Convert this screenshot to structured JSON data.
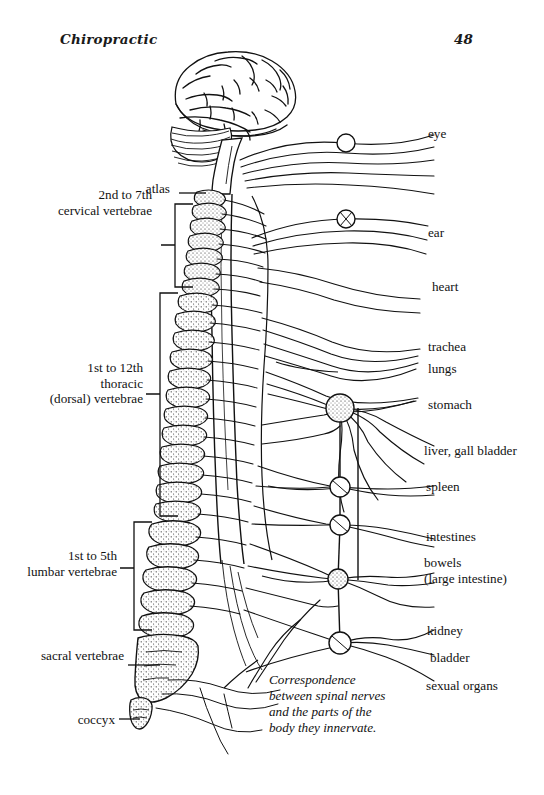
{
  "page": {
    "width": 544,
    "height": 795,
    "background_color": "#ffffff",
    "ink_color": "#121212"
  },
  "header": {
    "title": "Chiropractic",
    "page_number": "48"
  },
  "figure": {
    "style": "black and white line drawing",
    "caption": "Correspondence\nbetween spinal nerves\nand the parts of the\nbody they innervate."
  },
  "left_labels": [
    {
      "id": "atlas",
      "text": "atlas",
      "x": 171,
      "y": 188,
      "leader": "line"
    },
    {
      "id": "cervical",
      "text": "2nd to 7th\ncervical vertebrae",
      "x": 152,
      "y": 194,
      "leader": "bracket"
    },
    {
      "id": "thoracic",
      "text": "1st to 12th\nthoracic\n(dorsal) vertebrae",
      "x": 147,
      "y": 367,
      "leader": "bracket"
    },
    {
      "id": "lumbar",
      "text": "1st to 5th\nlumbar vertebrae",
      "x": 136,
      "y": 555,
      "leader": "bracket"
    },
    {
      "id": "sacral",
      "text": "sacral vertebrae",
      "x": 128,
      "y": 655,
      "leader": "line"
    },
    {
      "id": "coccyx",
      "text": "coccyx",
      "x": 127,
      "y": 713,
      "leader": "line"
    }
  ],
  "right_labels": [
    {
      "id": "eye",
      "text": "eye",
      "x": 428,
      "y": 133
    },
    {
      "id": "ear",
      "text": "ear",
      "x": 428,
      "y": 232
    },
    {
      "id": "heart",
      "text": "heart",
      "x": 432,
      "y": 286
    },
    {
      "id": "trackea",
      "text": "trachea",
      "x": 428,
      "y": 346
    },
    {
      "id": "lungs",
      "text": "lungs",
      "x": 428,
      "y": 368
    },
    {
      "id": "stomach",
      "text": "stomach",
      "x": 428,
      "y": 404
    },
    {
      "id": "liver-gall-bladder",
      "text": "liver, gall bladder",
      "x": 424,
      "y": 450
    },
    {
      "id": "spleen",
      "text": "spleen",
      "x": 426,
      "y": 486
    },
    {
      "id": "intestines",
      "text": "intestines",
      "x": 426,
      "y": 536
    },
    {
      "id": "bowels",
      "text": "bowels\n(large intestine)",
      "x": 424,
      "y": 562
    },
    {
      "id": "kidney",
      "text": "kidney",
      "x": 427,
      "y": 630
    },
    {
      "id": "bladder",
      "text": "bladder",
      "x": 430,
      "y": 657
    },
    {
      "id": "sexual-organs",
      "text": "sexual organs",
      "x": 426,
      "y": 685
    }
  ],
  "ganglia": [
    {
      "id": "ganglion-cervical-upper",
      "cx": 346,
      "cy": 143,
      "r": 9
    },
    {
      "id": "ganglion-cervical-lower",
      "cx": 346,
      "cy": 219,
      "r": 9
    },
    {
      "id": "ganglion-celiac",
      "cx": 340,
      "cy": 408,
      "r": 14
    },
    {
      "id": "ganglion-spleen",
      "cx": 340,
      "cy": 487,
      "r": 10
    },
    {
      "id": "ganglion-intestines",
      "cx": 340,
      "cy": 525,
      "r": 10
    },
    {
      "id": "ganglion-bowels",
      "cx": 338,
      "cy": 579,
      "r": 10
    },
    {
      "id": "ganglion-pelvic",
      "cx": 340,
      "cy": 643,
      "r": 11
    }
  ]
}
